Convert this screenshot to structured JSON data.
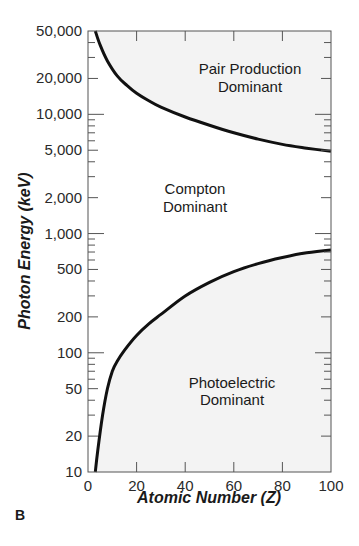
{
  "chart_data": {
    "type": "line",
    "title": "",
    "panel_label": "B",
    "xlabel": "Atomic Number (Z)",
    "ylabel": "Photon Energy (keV)",
    "xscale": "linear",
    "yscale": "log",
    "xlim": [
      0,
      100
    ],
    "ylim": [
      10,
      50000
    ],
    "grid": false,
    "legend": "none",
    "x_ticks": [
      0,
      20,
      40,
      60,
      80,
      100
    ],
    "x_tick_labels": [
      "0",
      "20",
      "40",
      "60",
      "80",
      "100"
    ],
    "y_ticks": [
      10,
      20,
      50,
      100,
      200,
      500,
      1000,
      2000,
      5000,
      10000,
      20000,
      50000
    ],
    "y_tick_labels": [
      "10",
      "20",
      "50",
      "100",
      "200",
      "500",
      "1,000",
      "2,000",
      "5,000",
      "10,000",
      "20,000",
      "50,000"
    ],
    "series": [
      {
        "name": "Pair production / Compton boundary",
        "x": [
          3,
          5,
          8,
          12,
          16,
          20,
          25,
          30,
          40,
          50,
          60,
          70,
          80,
          90,
          100
        ],
        "y": [
          50000,
          38000,
          28000,
          21000,
          17500,
          15000,
          13000,
          11500,
          9500,
          8100,
          7000,
          6200,
          5600,
          5200,
          4900
        ]
      },
      {
        "name": "Compton / Photoelectric boundary",
        "x": [
          3,
          4,
          6,
          8,
          10,
          12,
          15,
          20,
          25,
          30,
          40,
          50,
          60,
          70,
          80,
          90,
          100
        ],
        "y": [
          10,
          15,
          30,
          50,
          70,
          85,
          105,
          140,
          175,
          210,
          300,
          390,
          480,
          560,
          630,
          690,
          730
        ]
      }
    ],
    "regions": [
      {
        "label": "Pair Production\nDominant",
        "shaded": true
      },
      {
        "label": "Compton\nDominant",
        "shaded": false
      },
      {
        "label": "Photoelectric\nDominant",
        "shaded": true
      }
    ],
    "annotations": [
      "Pair Production Dominant",
      "Compton Dominant",
      "Photoelectric Dominant"
    ]
  },
  "labels": {
    "region_pair_1": "Pair Production",
    "region_pair_2": "Dominant",
    "region_compton_1": "Compton",
    "region_compton_2": "Dominant",
    "region_photo_1": "Photoelectric",
    "region_photo_2": "Dominant",
    "panel": "B",
    "xlabel": "Atomic Number (Z)",
    "ylabel": "Photon Energy (keV)"
  },
  "colors": {
    "shade": "#f3f3f3",
    "curve": "#111111",
    "axis": "#555555"
  }
}
